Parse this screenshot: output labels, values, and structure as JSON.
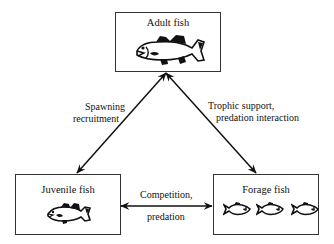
{
  "diagram": {
    "nodes": {
      "adult": {
        "label": "Adult fish",
        "icon": "large-bass-icon"
      },
      "juvenile": {
        "label": "Juvenile fish",
        "icon": "small-bass-icon"
      },
      "forage": {
        "label": "Forage fish",
        "icon": "forage-fish-icon",
        "icon_count": 3
      }
    },
    "edges": {
      "adult_juvenile": {
        "from": "Adult fish",
        "to": "Juvenile fish",
        "direction": "bidirectional",
        "label_line1": "Spawning",
        "label_line2": "recruitment"
      },
      "adult_forage": {
        "from": "Adult fish",
        "to": "Forage fish",
        "direction": "bidirectional",
        "label_line1": "Trophic support,",
        "label_line2": "predation interaction"
      },
      "juvenile_forage": {
        "from": "Juvenile fish",
        "to": "Forage fish",
        "direction": "bidirectional",
        "label_line1": "Competition,",
        "label_line2": "predation"
      }
    },
    "colors": {
      "line": "#111111",
      "box_border": "#333333",
      "background": "#ffffff"
    }
  }
}
